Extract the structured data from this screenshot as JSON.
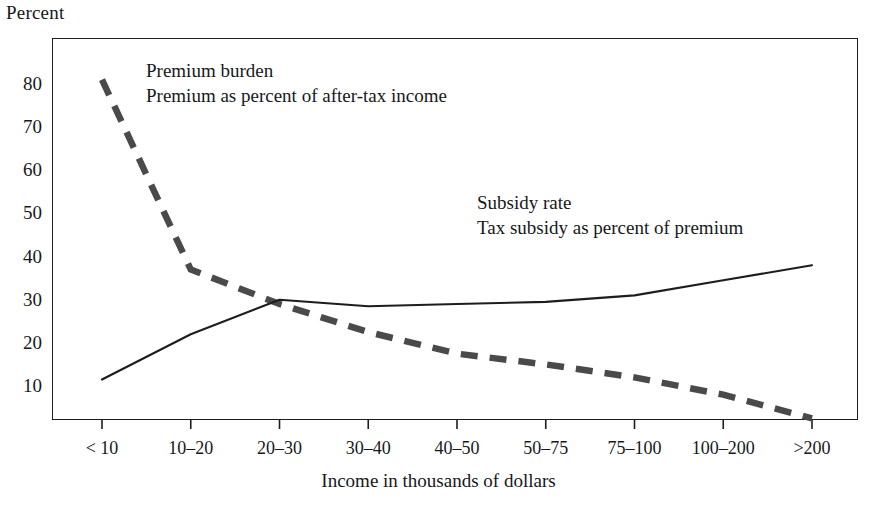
{
  "chart_data": {
    "type": "line",
    "title": "",
    "ylabel": "Percent",
    "xlabel": "Income in thousands of dollars",
    "categories": [
      "< 10",
      "10–20",
      "20–30",
      "30–40",
      "40–50",
      "50–75",
      "75–100",
      "100–200",
      ">200"
    ],
    "yticks": [
      10,
      20,
      30,
      40,
      50,
      60,
      70,
      80
    ],
    "ylim": [
      0,
      86
    ],
    "grid": false,
    "legend_position": "inline-annotation",
    "series": [
      {
        "name": "Premium burden",
        "description": "Premium as percent of after-tax income",
        "style": "dashed",
        "color": "#4a4a4a",
        "values": [
          81,
          37,
          29,
          22.5,
          17.5,
          15,
          12,
          8,
          2.5
        ]
      },
      {
        "name": "Subsidy rate",
        "description": "Tax subsidy as percent of premium",
        "style": "solid",
        "color": "#1d1d1f",
        "values": [
          11.5,
          22,
          30,
          28.5,
          29,
          29.5,
          31,
          34.5,
          38
        ]
      }
    ]
  },
  "axes": {
    "y_title": "Percent",
    "x_title": "Income in thousands of dollars",
    "y_tick_labels": [
      "80",
      "70",
      "60",
      "50",
      "40",
      "30",
      "20",
      "10"
    ],
    "x_tick_labels": [
      "< 10",
      "10–20",
      "20–30",
      "30–40",
      "40–50",
      "50–75",
      "75–100",
      "100–200",
      ">200"
    ]
  },
  "annotations": {
    "premium_burden": {
      "title": "Premium burden",
      "subtitle": "Premium as percent of after-tax income"
    },
    "subsidy_rate": {
      "title": "Subsidy rate",
      "subtitle": "Tax subsidy as percent of premium"
    }
  },
  "colors": {
    "frame": "#1d1d1f",
    "solid_series": "#1d1d1f",
    "dashed_series": "#4a4a4a",
    "text": "#17181a",
    "background": "#ffffff"
  }
}
